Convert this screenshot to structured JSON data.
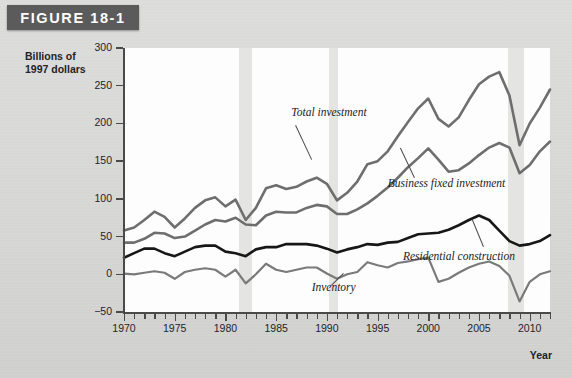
{
  "figure": {
    "banner_label": "FIGURE 18-1",
    "banner_color": "#5b5b5b"
  },
  "axes": {
    "y_title_line1": "Billions of",
    "y_title_line2": "1997 dollars",
    "x_axis_name": "Year",
    "y_ticks": [
      "300",
      "250",
      "200",
      "150",
      "100",
      "50",
      "0",
      "−50"
    ],
    "x_labels": [
      "1970",
      "1975",
      "1980",
      "1985",
      "1990",
      "1995",
      "2000",
      "2005",
      "2010"
    ]
  },
  "labels": {
    "total_investment": "Total investment",
    "business_fixed_investment": "Business fixed investment",
    "residential_construction": "Residential construction",
    "inventory": "Inventory"
  },
  "chart_data": {
    "type": "line",
    "title": "FIGURE 18-1",
    "xlabel": "Year",
    "ylabel": "Billions of 1997 dollars",
    "xlim": [
      1970,
      2012
    ],
    "ylim": [
      -50,
      300
    ],
    "ytick_step": 50,
    "xtick_step": 1,
    "xtick_label_step": 5,
    "grid": false,
    "legend": "inline-annotations",
    "recession_bands": [
      {
        "start": 1981.3,
        "end": 1982.6
      },
      {
        "start": 1990.2,
        "end": 1991.1
      },
      {
        "start": 2007.9,
        "end": 2009.4
      }
    ],
    "recession_color": "#e4e4e2",
    "x": [
      1970,
      1971,
      1972,
      1973,
      1974,
      1975,
      1976,
      1977,
      1978,
      1979,
      1980,
      1981,
      1982,
      1983,
      1984,
      1985,
      1986,
      1987,
      1988,
      1989,
      1990,
      1991,
      1992,
      1993,
      1994,
      1995,
      1996,
      1997,
      1998,
      1999,
      2000,
      2001,
      2002,
      2003,
      2004,
      2005,
      2006,
      2007,
      2008,
      2009,
      2010,
      2011,
      2012
    ],
    "series": [
      {
        "name": "Total investment",
        "color": "#6e6e6e",
        "width": 2.6,
        "values": [
          58,
          62,
          72,
          83,
          76,
          62,
          74,
          88,
          98,
          102,
          90,
          99,
          72,
          88,
          114,
          118,
          113,
          116,
          123,
          128,
          120,
          98,
          108,
          123,
          146,
          150,
          163,
          183,
          202,
          220,
          233,
          206,
          196,
          208,
          231,
          252,
          262,
          268,
          237,
          171,
          200,
          221,
          245
        ]
      },
      {
        "name": "Business fixed investment",
        "color": "#6e6e6e",
        "width": 2.6,
        "values": [
          42,
          42,
          47,
          55,
          54,
          48,
          50,
          58,
          66,
          72,
          70,
          75,
          66,
          65,
          78,
          83,
          82,
          82,
          88,
          92,
          90,
          80,
          80,
          86,
          94,
          104,
          115,
          128,
          142,
          154,
          167,
          152,
          136,
          138,
          147,
          158,
          168,
          174,
          168,
          134,
          145,
          163,
          176
        ]
      },
      {
        "name": "Residential construction",
        "color": "#171717",
        "width": 2.6,
        "values": [
          22,
          28,
          34,
          34,
          28,
          24,
          30,
          36,
          38,
          38,
          30,
          28,
          24,
          33,
          36,
          36,
          40,
          40,
          40,
          38,
          34,
          29,
          33,
          36,
          40,
          39,
          42,
          43,
          48,
          53,
          54,
          55,
          59,
          65,
          72,
          78,
          72,
          58,
          44,
          38,
          40,
          44,
          52
        ]
      },
      {
        "name": "Inventory",
        "color": "#7a7a7a",
        "width": 2.2,
        "values": [
          1,
          0,
          2,
          4,
          2,
          -6,
          3,
          6,
          8,
          6,
          -3,
          6,
          -12,
          0,
          14,
          6,
          3,
          6,
          9,
          9,
          1,
          -6,
          0,
          3,
          16,
          12,
          9,
          15,
          17,
          20,
          22,
          -10,
          -6,
          2,
          9,
          14,
          17,
          11,
          -2,
          -36,
          -10,
          0,
          4
        ]
      }
    ],
    "annotations": [
      {
        "text": "Total investment",
        "x": 1986.5,
        "y": 212
      },
      {
        "text": "Business fixed investment",
        "x": 1996.0,
        "y": 118
      },
      {
        "text": "Residential construction",
        "x": 1997.5,
        "y": 22
      },
      {
        "text": "Inventory",
        "x": 1988.5,
        "y": -20
      }
    ]
  }
}
